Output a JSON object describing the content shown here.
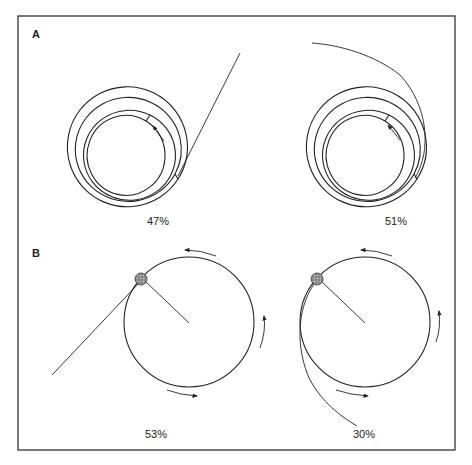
{
  "figure": {
    "panels": [
      {
        "id": "A",
        "label": "A",
        "description": "Spiral channel with ball exit paths",
        "subfigures": [
          {
            "name": "spiral-left",
            "exit": "straight-line",
            "percent": "47%"
          },
          {
            "name": "spiral-right",
            "exit": "curved-path",
            "percent": "51%"
          }
        ]
      },
      {
        "id": "B",
        "label": "B",
        "description": "Ball on string swung in circle, released",
        "subfigures": [
          {
            "name": "circle-left",
            "exit": "straight-tangent",
            "percent": "53%"
          },
          {
            "name": "circle-right",
            "exit": "curved-path",
            "percent": "30%"
          }
        ]
      }
    ],
    "colors": {
      "line": "#222222",
      "background": "#ffffff",
      "ball": "#888888"
    }
  }
}
